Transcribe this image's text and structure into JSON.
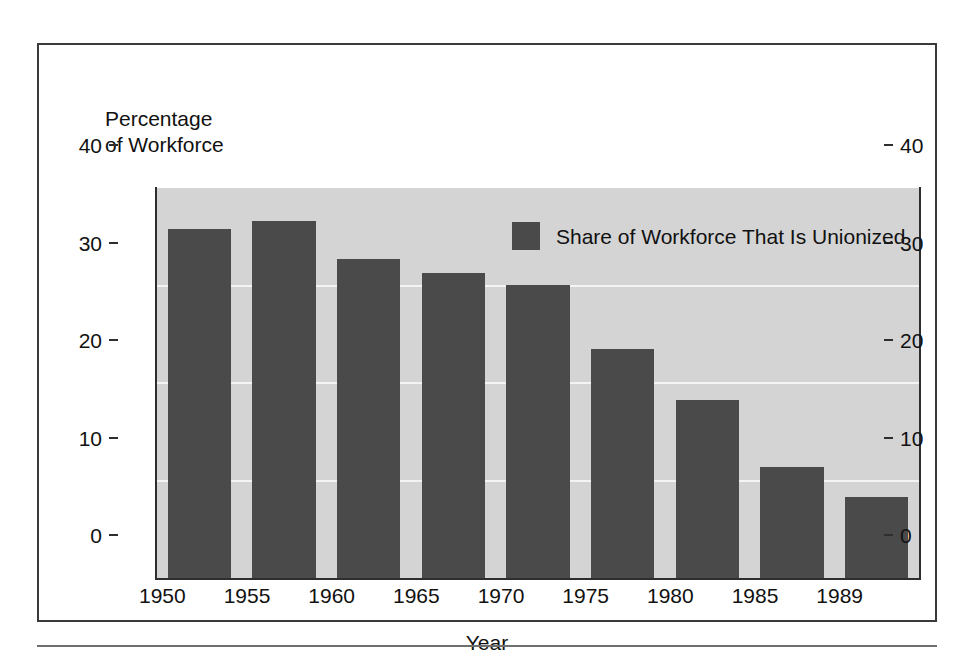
{
  "figure": {
    "y_axis_caption": "Percentage\nof Workforce",
    "x_axis_title": "Year"
  },
  "legend": {
    "swatch_name": "legend-color-swatch",
    "label": "Share of Workforce That Is Unionized",
    "color": "#4a4a4a"
  },
  "colors": {
    "bar": "#4a4a4a",
    "plot_background": "#d4d4d4",
    "gridline": "#f4f4f4",
    "axis": "#2e2e2e",
    "frame": "#3a3a3a",
    "text": "#111111"
  },
  "axes": {
    "y_ticks": [
      "0",
      "10",
      "20",
      "30",
      "40"
    ],
    "y_ticks_right": [
      "0",
      "10",
      "20",
      "30",
      "40"
    ],
    "x_ticks": [
      "1950",
      "1955",
      "1960",
      "1965",
      "1970",
      "1975",
      "1980",
      "1985",
      "1989"
    ]
  },
  "chart_data": {
    "type": "bar",
    "title": "",
    "subtitle": "",
    "xlabel": "Year",
    "ylabel": "Percentage of Workforce",
    "categories": [
      "1950",
      "1955",
      "1960",
      "1965",
      "1970",
      "1975",
      "1980",
      "1985",
      "1989"
    ],
    "values": [
      35.8,
      36.6,
      32.7,
      31.3,
      30.1,
      23.5,
      18.3,
      11.4,
      8.3
    ],
    "series": [
      {
        "name": "Share of Workforce That Is Unionized",
        "values": [
          35.8,
          36.6,
          32.7,
          31.3,
          30.1,
          23.5,
          18.3,
          11.4,
          8.3
        ],
        "color": "#4a4a4a"
      }
    ],
    "ylim": [
      0,
      40
    ],
    "yticks": [
      0,
      10,
      20,
      30,
      40
    ],
    "grid": true,
    "grid_axis": "y",
    "legend_position": "inside-top-right",
    "dual_y_axis": true
  }
}
